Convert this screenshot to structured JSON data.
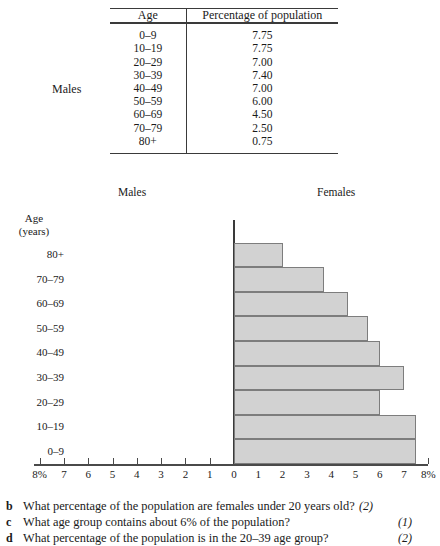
{
  "table": {
    "side_label": "Males",
    "headers": [
      "Age",
      "Percentage of population"
    ],
    "rows": [
      {
        "age": "0–9",
        "pct": "7.75"
      },
      {
        "age": "10–19",
        "pct": "7.75"
      },
      {
        "age": "20–29",
        "pct": "7.00"
      },
      {
        "age": "30–39",
        "pct": "7.40"
      },
      {
        "age": "40–49",
        "pct": "7.00"
      },
      {
        "age": "50–59",
        "pct": "6.00"
      },
      {
        "age": "60–69",
        "pct": "4.50"
      },
      {
        "age": "70–79",
        "pct": "2.50"
      },
      {
        "age": "80+",
        "pct": "0.75"
      }
    ]
  },
  "chart_headers": {
    "males": "Males",
    "females": "Females"
  },
  "y_axis_title_line1": "Age",
  "y_axis_title_line2": "(years)",
  "chart_data": {
    "type": "bar",
    "orientation": "horizontal",
    "xlabel": "",
    "ylabel": "Age (years)",
    "categories": [
      "0–9",
      "10–19",
      "20–29",
      "30–39",
      "40–49",
      "50–59",
      "60–69",
      "70–79",
      "80+"
    ],
    "series": [
      {
        "name": "Males",
        "values": [
          null,
          null,
          null,
          null,
          null,
          null,
          null,
          null,
          null
        ]
      },
      {
        "name": "Females",
        "values": [
          7.5,
          7.5,
          6.0,
          7.0,
          6.0,
          5.5,
          4.7,
          3.7,
          2.0
        ]
      }
    ],
    "xlim": [
      -8,
      8
    ],
    "x_tick_values": [
      -8,
      -7,
      -6,
      -5,
      -4,
      -3,
      -2,
      -1,
      0,
      1,
      2,
      3,
      4,
      5,
      6,
      7,
      8
    ],
    "x_tick_labels": [
      "8%",
      "7",
      "6",
      "5",
      "4",
      "3",
      "2",
      "1",
      "0",
      "1",
      "2",
      "3",
      "4",
      "5",
      "6",
      "7",
      "8%"
    ],
    "grid": false,
    "legend": "none",
    "bar_fill": "#d2d2d2",
    "bar_stroke": "#7d7d7d"
  },
  "questions": [
    {
      "letter": "b",
      "text": "What percentage of the population are females under 20 years old?",
      "marks": "(2)"
    },
    {
      "letter": "c",
      "text": "What age group contains about 6% of the population?",
      "marks": "(1)"
    },
    {
      "letter": "d",
      "text": "What percentage of the population is in the 20–39 age group?",
      "marks": "(2)"
    }
  ]
}
